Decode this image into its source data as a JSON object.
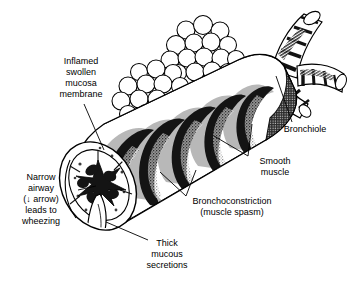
{
  "figure": {
    "background_color": "#ffffff",
    "ink_color": "#000000",
    "band_fill_color": "#b8b8b8",
    "width": 348,
    "height": 283
  },
  "labels": {
    "inflamed": "Inflamed\nswollen\nmucosa\nmembrane",
    "narrow_airway": "Narrow\nairway\n(↓ arrow)\nleads to\nwheezing",
    "thick_mucous": "Thick\nmucous\nsecretions",
    "bronchoconstriction": "Bronchoconstriction\n(muscle spasm)",
    "smooth_muscle": "Smooth\nmuscle",
    "bronchiole": "Bronchiole"
  },
  "anatomy": {
    "parts": [
      "alveolar-sac-cluster",
      "bronchiole-branch",
      "main-bronchus",
      "constricted-rings",
      "cut-away-cross-section",
      "mucus-plug"
    ]
  }
}
